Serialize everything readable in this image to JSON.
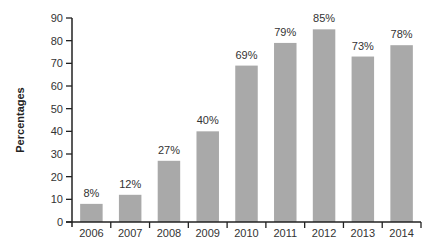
{
  "chart_data": {
    "type": "bar",
    "title": "",
    "xlabel": "",
    "ylabel": "Percentages",
    "ylim": [
      0,
      90
    ],
    "yticks": [
      0,
      10,
      20,
      30,
      40,
      50,
      60,
      70,
      80,
      90
    ],
    "grid": false,
    "legend": null,
    "categories": [
      "2006",
      "2007",
      "2008",
      "2009",
      "2010",
      "2011",
      "2012",
      "2013",
      "2014"
    ],
    "values": [
      8,
      12,
      27,
      40,
      69,
      79,
      85,
      73,
      78
    ],
    "data_labels": [
      "8%",
      "12%",
      "27%",
      "40%",
      "69%",
      "79%",
      "85%",
      "73%",
      "78%"
    ],
    "colors": {
      "bar": "#a9a9a9",
      "axis": "#222222",
      "text": "#333333"
    }
  }
}
